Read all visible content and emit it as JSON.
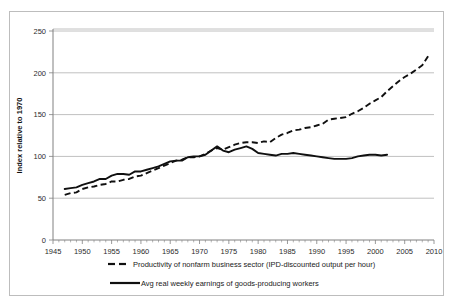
{
  "caption_sliver": "                                                                                         ",
  "axes": {
    "ylabel": "Index relative to 1970",
    "yticks": [
      0,
      50,
      100,
      150,
      200,
      250
    ],
    "xticks": [
      1945,
      1950,
      1955,
      1960,
      1965,
      1970,
      1975,
      1980,
      1985,
      1990,
      1995,
      2000,
      2005,
      2010
    ]
  },
  "legend": {
    "items": [
      {
        "label": "Productivity of nonfarm business sector (IPD-discounted output per hour)",
        "style": "dashed"
      },
      {
        "label": "Avg real weekly earnings of goods-producing workers",
        "style": "solid"
      }
    ]
  },
  "chart_data": {
    "type": "line",
    "title": "",
    "xlabel": "",
    "ylabel": "Index relative to 1970",
    "xlim": [
      1945,
      2010
    ],
    "ylim": [
      0,
      250
    ],
    "grid": true,
    "legend_position": "bottom",
    "series": [
      {
        "name": "Productivity of nonfarm business sector (IPD-discounted output per hour)",
        "style": "dashed",
        "color": "#101010",
        "x": [
          1947,
          1948,
          1949,
          1950,
          1951,
          1952,
          1953,
          1954,
          1955,
          1956,
          1957,
          1958,
          1959,
          1960,
          1961,
          1962,
          1963,
          1964,
          1965,
          1966,
          1967,
          1968,
          1969,
          1970,
          1971,
          1972,
          1973,
          1974,
          1975,
          1976,
          1977,
          1978,
          1979,
          1980,
          1981,
          1982,
          1983,
          1984,
          1985,
          1986,
          1987,
          1988,
          1989,
          1990,
          1991,
          1992,
          1993,
          1994,
          1995,
          1996,
          1997,
          1998,
          1999,
          2000,
          2001,
          2002,
          2003,
          2004,
          2005,
          2006,
          2007,
          2008,
          2009
        ],
        "y": [
          54,
          56,
          57,
          61,
          63,
          64,
          66,
          67,
          70,
          70,
          72,
          73,
          76,
          77,
          80,
          83,
          86,
          89,
          92,
          95,
          96,
          99,
          99,
          100,
          103,
          107,
          110,
          108,
          111,
          114,
          116,
          117,
          117,
          116,
          118,
          117,
          122,
          126,
          128,
          131,
          132,
          134,
          135,
          137,
          139,
          144,
          145,
          146,
          147,
          151,
          154,
          158,
          163,
          167,
          171,
          178,
          184,
          190,
          195,
          199,
          204,
          209,
          220
        ]
      },
      {
        "name": "Avg real weekly earnings of goods-producing workers",
        "style": "solid",
        "color": "#101010",
        "x": [
          1947,
          1948,
          1949,
          1950,
          1951,
          1952,
          1953,
          1954,
          1955,
          1956,
          1957,
          1958,
          1959,
          1960,
          1961,
          1962,
          1963,
          1964,
          1965,
          1966,
          1967,
          1968,
          1969,
          1970,
          1971,
          1972,
          1973,
          1974,
          1975,
          1976,
          1977,
          1978,
          1979,
          1980,
          1981,
          1982,
          1983,
          1984,
          1985,
          1986,
          1987,
          1988,
          1989,
          1990,
          1991,
          1992,
          1993,
          1994,
          1995,
          1996,
          1997,
          1998,
          1999,
          2000,
          2001,
          2002
        ],
        "y": [
          61,
          62,
          63,
          66,
          68,
          70,
          73,
          73,
          77,
          79,
          79,
          78,
          82,
          82,
          84,
          86,
          88,
          91,
          94,
          95,
          95,
          99,
          100,
          100,
          102,
          107,
          112,
          107,
          105,
          108,
          110,
          112,
          109,
          104,
          103,
          102,
          101,
          103,
          103,
          104,
          103,
          102,
          101,
          100,
          99,
          98,
          97,
          97,
          97,
          98,
          100,
          101,
          102,
          102,
          101,
          102
        ]
      }
    ]
  }
}
